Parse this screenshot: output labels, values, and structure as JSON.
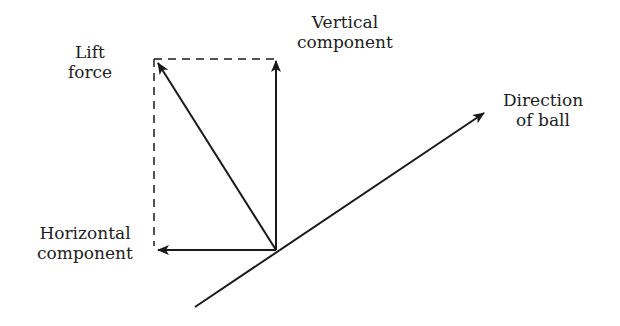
{
  "diagram": {
    "labels": {
      "lift_1": "Lift",
      "lift_2": "force",
      "vertical_1": "Vertical",
      "vertical_2": "component",
      "horizontal_1": "Horizontal",
      "horizontal_2": "component",
      "direction_1": "Direction",
      "direction_2": "of ball"
    },
    "colors": {
      "stroke": "#1a1a1a",
      "text": "#222222"
    }
  }
}
